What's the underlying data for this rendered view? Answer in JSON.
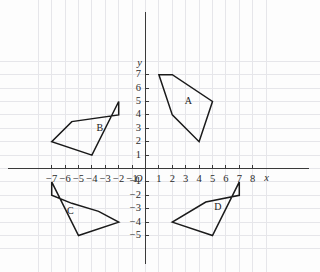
{
  "chart_data": {
    "type": "scatter",
    "title": "",
    "xlabel": "x",
    "ylabel": "y",
    "grid": true,
    "legend_position": "none",
    "origin_label": "O",
    "xlim": [
      -8,
      9
    ],
    "ylim": [
      -6,
      8
    ],
    "x_ticks": [
      -7,
      -6,
      -5,
      -4,
      -3,
      -2,
      -1,
      1,
      2,
      3,
      4,
      5,
      6,
      7,
      8
    ],
    "y_ticks": [
      7,
      6,
      5,
      4,
      3,
      2,
      1,
      -1,
      -2,
      -3,
      -4,
      -5
    ],
    "x_tick_labels": [
      "−7",
      "−6",
      "−5",
      "−4",
      "−3",
      "−2",
      "−1",
      "1",
      "2",
      "3",
      "4",
      "5",
      "6",
      "7",
      "8"
    ],
    "y_tick_labels": [
      "7",
      "6",
      "5",
      "4",
      "3",
      "2",
      "1",
      "−1",
      "−2",
      "−3",
      "−4",
      "−5"
    ],
    "shapes": [
      {
        "name": "A",
        "label": "A",
        "label_position": [
          3.2,
          5.0
        ],
        "quadrant": "I",
        "vertices": [
          [
            1,
            7
          ],
          [
            2,
            7
          ],
          [
            5,
            5
          ],
          [
            4,
            2
          ],
          [
            2,
            4
          ]
        ]
      },
      {
        "name": "B",
        "label": "B",
        "label_position": [
          -3.4,
          3.0
        ],
        "quadrant": "II",
        "vertices": [
          [
            -2,
            5
          ],
          [
            -2,
            4
          ],
          [
            -5.5,
            3.5
          ],
          [
            -7,
            2
          ],
          [
            -4,
            1
          ]
        ]
      },
      {
        "name": "C",
        "label": "C",
        "label_position": [
          -5.6,
          -3.2
        ],
        "quadrant": "III",
        "vertices": [
          [
            -7,
            -1
          ],
          [
            -7,
            -2
          ],
          [
            -5.5,
            -2.6
          ],
          [
            -3.5,
            -3.2
          ],
          [
            -2,
            -4
          ],
          [
            -5,
            -5
          ]
        ]
      },
      {
        "name": "D",
        "label": "D",
        "label_position": [
          5.4,
          -2.9
        ],
        "quadrant": "IV",
        "vertices": [
          [
            7,
            -1
          ],
          [
            7,
            -2
          ],
          [
            4.5,
            -2.5
          ],
          [
            2,
            -4
          ],
          [
            5,
            -5
          ]
        ]
      }
    ]
  },
  "colors": {
    "background": "#fdfdfd",
    "grid": "#e6e6ea",
    "axis": "#3a3a3a",
    "shape_stroke": "#1a1a1a",
    "text": "#2b2b2b"
  }
}
